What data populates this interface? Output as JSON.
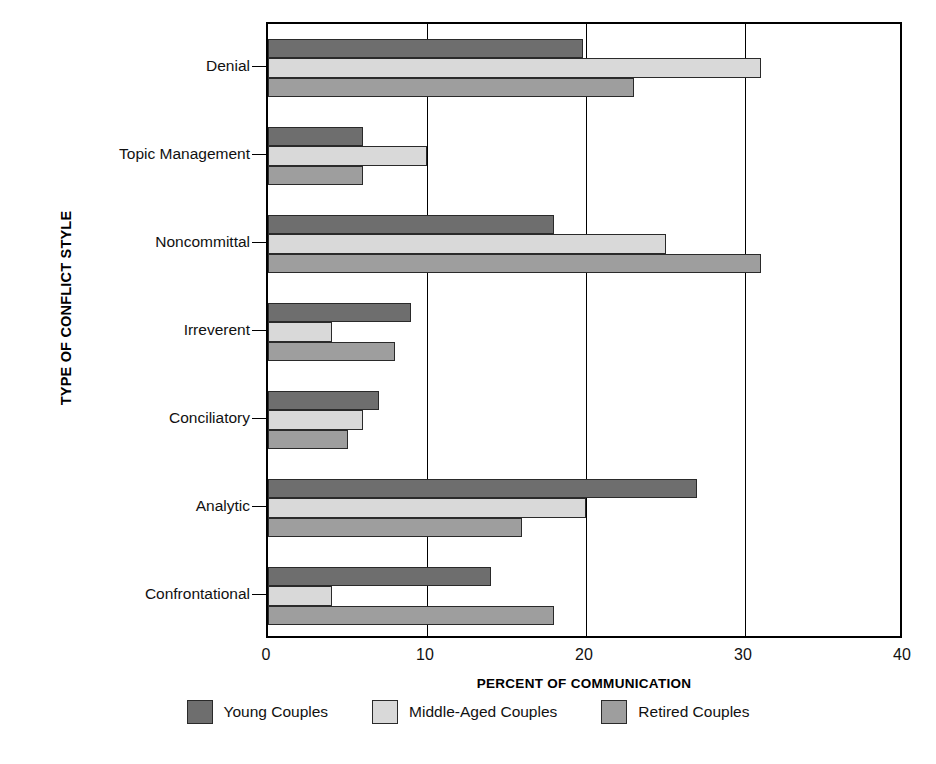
{
  "chart_data": {
    "type": "bar",
    "orientation": "horizontal",
    "title": "",
    "xlabel": "PERCENT OF COMMUNICATION",
    "ylabel": "TYPE OF CONFLICT STYLE",
    "xlim": [
      0,
      40
    ],
    "xticks": [
      0,
      10,
      20,
      30,
      40
    ],
    "xtick_labels": [
      "0",
      "10",
      "20",
      "30",
      "40"
    ],
    "grid": true,
    "grid_axis": "x",
    "legend_position": "bottom",
    "categories": [
      "Denial",
      "Topic Management",
      "Noncommittal",
      "Irreverent",
      "Conciliatory",
      "Analytic",
      "Confrontational"
    ],
    "series": [
      {
        "name": "Young Couples",
        "color": "#6e6e6e",
        "values": [
          19.8,
          6,
          18,
          9,
          7,
          27,
          14
        ]
      },
      {
        "name": "Middle-Aged Couples",
        "color": "#d9d9d9",
        "values": [
          31,
          10,
          25,
          4,
          6,
          20,
          4
        ]
      },
      {
        "name": "Retired Couples",
        "color": "#9e9e9e",
        "values": [
          23,
          6,
          31,
          8,
          5,
          16,
          18
        ]
      }
    ]
  },
  "axes": {
    "y_title": "TYPE OF CONFLICT STYLE",
    "x_title": "PERCENT OF COMMUNICATION"
  },
  "legend": {
    "items": [
      {
        "label": "Young Couples",
        "color": "#6e6e6e"
      },
      {
        "label": "Middle-Aged Couples",
        "color": "#d9d9d9"
      },
      {
        "label": "Retired Couples",
        "color": "#9e9e9e"
      }
    ]
  }
}
